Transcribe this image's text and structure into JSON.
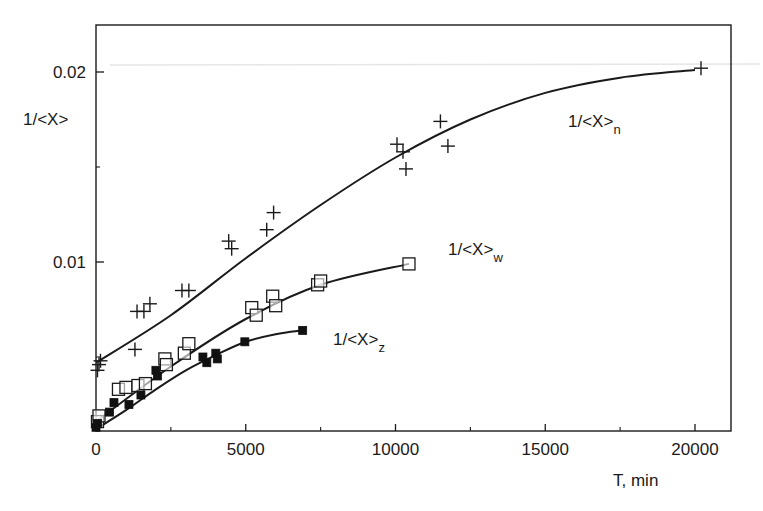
{
  "chart_data": {
    "type": "scatter",
    "title": "",
    "xlabel": "T, min",
    "ylabel": "1/<X>",
    "xlim": [
      0,
      21000
    ],
    "ylim": [
      0.00116,
      0.0229
    ],
    "grid": false,
    "x_ticks": [
      0,
      5000,
      10000,
      15000,
      20000
    ],
    "x_tick_labels": [
      "0",
      "5000",
      "10000",
      "15000",
      "20000"
    ],
    "x_minor_ticks": [
      2500,
      7500,
      12500,
      17500
    ],
    "y_ticks": [
      0.01,
      0.02
    ],
    "y_tick_labels": [
      "0.01",
      "0.02"
    ],
    "y_minor_ticks": [
      0.005,
      0.015
    ],
    "legend": "inline annotations",
    "series": [
      {
        "name": "1/<X>_n",
        "label_main": "1/<X>",
        "label_sub": "n",
        "marker": "plus",
        "points": [
          [
            50,
            0.0043
          ],
          [
            100,
            0.0046
          ],
          [
            150,
            0.0048
          ],
          [
            1300,
            0.0054
          ],
          [
            1370,
            0.0074
          ],
          [
            1600,
            0.0074
          ],
          [
            1800,
            0.0078
          ],
          [
            2870,
            0.0085
          ],
          [
            3100,
            0.0085
          ],
          [
            4430,
            0.0111
          ],
          [
            4530,
            0.0107
          ],
          [
            5700,
            0.0117
          ],
          [
            5930,
            0.0126
          ],
          [
            10050,
            0.0162
          ],
          [
            10250,
            0.0158
          ],
          [
            10350,
            0.0149
          ],
          [
            11500,
            0.0174
          ],
          [
            11750,
            0.0161
          ],
          [
            20200,
            0.0202
          ]
        ],
        "fit": [
          [
            0,
            0.0047
          ],
          [
            2500,
            0.0072
          ],
          [
            5000,
            0.0102
          ],
          [
            7500,
            0.013
          ],
          [
            10000,
            0.0155
          ],
          [
            12500,
            0.0175
          ],
          [
            15000,
            0.0189
          ],
          [
            17500,
            0.0197
          ],
          [
            20000,
            0.0201
          ]
        ]
      },
      {
        "name": "1/<X>_w",
        "label_main": "1/<X>",
        "label_sub": "w",
        "marker": "open-square",
        "points": [
          [
            50,
            0.0016
          ],
          [
            100,
            0.0019
          ],
          [
            750,
            0.0033
          ],
          [
            1000,
            0.0034
          ],
          [
            1400,
            0.0035
          ],
          [
            1650,
            0.0036
          ],
          [
            2300,
            0.0049
          ],
          [
            2350,
            0.0046
          ],
          [
            2950,
            0.0052
          ],
          [
            3100,
            0.0057
          ],
          [
            5200,
            0.0076
          ],
          [
            5350,
            0.0072
          ],
          [
            5900,
            0.0082
          ],
          [
            6000,
            0.0077
          ],
          [
            7400,
            0.0088
          ],
          [
            7500,
            0.009
          ],
          [
            10450,
            0.0099
          ]
        ],
        "fit": [
          [
            0,
            0.0016
          ],
          [
            2500,
            0.0045
          ],
          [
            5000,
            0.007
          ],
          [
            7500,
            0.0088
          ],
          [
            10450,
            0.0099
          ]
        ]
      },
      {
        "name": "1/<X>_z",
        "label_main": "1/<X>",
        "label_sub": "z",
        "marker": "filled-square",
        "points": [
          [
            0,
            0.0013
          ],
          [
            50,
            0.0015
          ],
          [
            450,
            0.0021
          ],
          [
            600,
            0.0026
          ],
          [
            1100,
            0.0025
          ],
          [
            1500,
            0.003
          ],
          [
            2000,
            0.0043
          ],
          [
            2050,
            0.004
          ],
          [
            3570,
            0.005
          ],
          [
            3700,
            0.0047
          ],
          [
            4000,
            0.0052
          ],
          [
            4050,
            0.0049
          ],
          [
            4970,
            0.0058
          ],
          [
            6900,
            0.0064
          ]
        ],
        "fit": [
          [
            0,
            0.0012
          ],
          [
            1000,
            0.0022
          ],
          [
            2000,
            0.0033
          ],
          [
            3000,
            0.0043
          ],
          [
            4000,
            0.0051
          ],
          [
            5000,
            0.0058
          ],
          [
            6000,
            0.0062
          ],
          [
            6900,
            0.0064
          ]
        ]
      }
    ]
  }
}
